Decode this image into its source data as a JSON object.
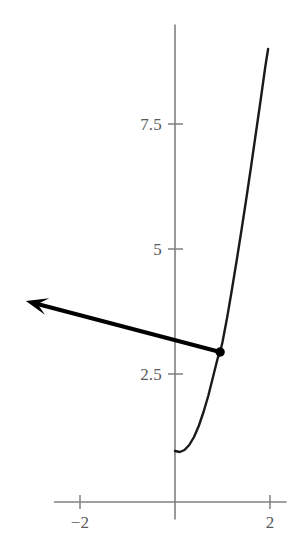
{
  "figure": {
    "background_color": "#ffffff",
    "axis_color": "#808080",
    "curve_color": "#1a1a1a",
    "tangent_color": "#000000",
    "point_color": "#000000",
    "label_color": "#5a5a5a"
  },
  "axes": {
    "x_label": "",
    "y_label": "",
    "xlim": [
      -2.55,
      2.35
    ],
    "ylim": [
      -0.35,
      9.55
    ],
    "origin_px": [
      175,
      502
    ],
    "x_scale_px_per_unit": 47.5,
    "y_scale_px_per_unit": 50.0,
    "y_ticks": [
      {
        "value": 2.5,
        "label": "2.5"
      },
      {
        "value": 5,
        "label": "5"
      },
      {
        "value": 7.5,
        "label": "7.5"
      }
    ],
    "x_ticks": [
      {
        "value": -2,
        "label": "−2"
      },
      {
        "value": 2,
        "label": "2"
      }
    ]
  },
  "chart_data": {
    "type": "line",
    "title": "",
    "subtitle": "",
    "xlabel": "",
    "ylabel": "",
    "xlim": [
      -2.55,
      2.35
    ],
    "ylim": [
      -0.35,
      9.55
    ],
    "grid": false,
    "legend": null,
    "xticks": [
      -2,
      2
    ],
    "xticklabels": [
      "−2",
      "2"
    ],
    "yticks": [
      2.5,
      5,
      7.5
    ],
    "yticklabels": [
      "2.5",
      "5",
      "7.5"
    ],
    "series": [
      {
        "name": "curve",
        "type": "line",
        "color": "#1a1a1a",
        "linewidth": 2,
        "x": [
          0.0,
          0.1,
          0.2,
          0.3,
          0.4,
          0.5,
          0.6,
          0.7,
          0.8,
          0.9,
          0.95,
          1.0,
          1.1,
          1.2,
          1.3,
          1.4,
          1.5,
          1.6,
          1.7,
          1.8,
          1.9,
          1.96
        ],
        "y": [
          1.02,
          1.0,
          1.04,
          1.14,
          1.3,
          1.52,
          1.8,
          2.12,
          2.5,
          2.88,
          3.0,
          3.2,
          3.7,
          4.26,
          4.84,
          5.44,
          6.06,
          6.7,
          7.36,
          8.02,
          8.7,
          9.06
        ]
      },
      {
        "name": "tangent-line",
        "type": "line",
        "color": "#000000",
        "linewidth": 4,
        "arrow": "left",
        "x": [
          0.95,
          -3.14
        ],
        "y": [
          3.0,
          4.02
        ]
      }
    ],
    "points": [
      {
        "name": "tangent-point",
        "x": 0.95,
        "y": 3.0,
        "color": "#000000",
        "size": 6
      }
    ],
    "annotations": []
  }
}
